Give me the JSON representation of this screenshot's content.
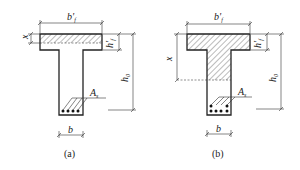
{
  "figure": {
    "panels": [
      {
        "id": "a",
        "caption": "(a)",
        "description": "T-section, neutral axis within flange (x ≤ h'f)",
        "labels": {
          "flange_width": "b'",
          "flange_width_sub": "f",
          "flange_thickness": "h'",
          "flange_thickness_sub": "f",
          "compression_depth": "x",
          "effective_depth": "h",
          "effective_depth_sub": "0",
          "steel_area": "A",
          "steel_area_sub": "s",
          "web_width": "b"
        }
      },
      {
        "id": "b",
        "caption": "(b)",
        "description": "T-section, neutral axis within web (x > h'f)",
        "labels": {
          "flange_width": "b'",
          "flange_width_sub": "f",
          "flange_thickness": "h'",
          "flange_thickness_sub": "f",
          "compression_depth": "x",
          "effective_depth": "h",
          "effective_depth_sub": "0",
          "steel_area": "A",
          "steel_area_sub": "s",
          "web_width": "b"
        }
      }
    ],
    "colors": {
      "line": "#222222",
      "hatch": "#555555",
      "background": "#ffffff"
    }
  }
}
